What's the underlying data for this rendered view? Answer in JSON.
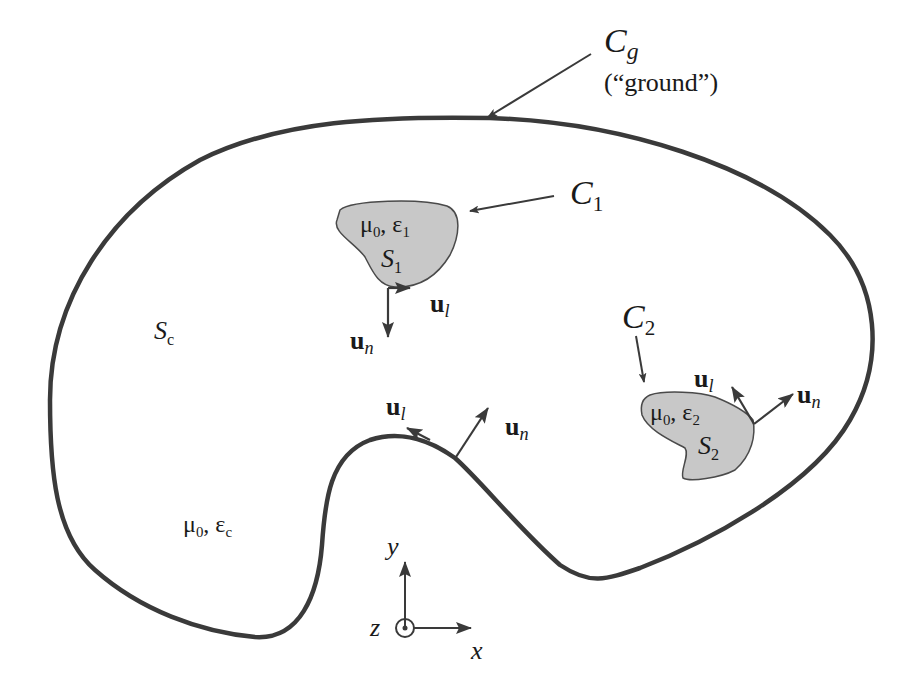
{
  "figure": {
    "ground_contour": {
      "symbol": "C",
      "subscript": "g",
      "caption": "(“ground”)"
    },
    "region_c": {
      "symbol": "S",
      "subscript": "c",
      "material_mu": "μ",
      "material_mu_sub": "0",
      "material_sep": ", ",
      "material_eps": "ε",
      "material_eps_sub": "c"
    },
    "conductor_1": {
      "contour_symbol": "C",
      "contour_subscript": "1",
      "region_symbol": "S",
      "region_subscript": "1",
      "material_mu": "μ",
      "material_mu_sub": "0",
      "material_sep": ", ",
      "material_eps": "ε",
      "material_eps_sub": "1",
      "fill_color": "#c8c8c8"
    },
    "conductor_2": {
      "contour_symbol": "C",
      "contour_subscript": "2",
      "region_symbol": "S",
      "region_subscript": "2",
      "material_mu": "μ",
      "material_mu_sub": "0",
      "material_sep": ", ",
      "material_eps": "ε",
      "material_eps_sub": "2",
      "fill_color": "#c8c8c8"
    },
    "unit_vectors": {
      "tangential": {
        "base": "u",
        "sub": "l"
      },
      "normal": {
        "base": "u",
        "sub": "n"
      }
    },
    "axes": {
      "x": "x",
      "y": "y",
      "z": "z"
    },
    "colors": {
      "stroke": "#3a3a3a",
      "fill": "#c8c8c8",
      "text": "#1a1a1a"
    }
  }
}
